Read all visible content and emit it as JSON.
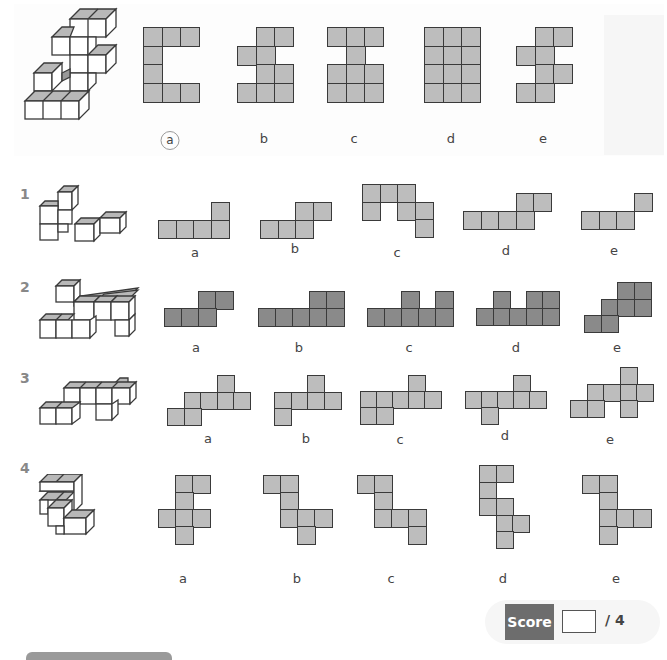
{
  "page": {
    "theme": {
      "cell_light": "#bdbdbd",
      "cell_dark": "#8a8a8a",
      "line": "#3a3a3a",
      "score_bg": "#6d6d6d"
    }
  },
  "example": {
    "answer_label": "a",
    "options": [
      {
        "label": "a",
        "circled": true,
        "x": 143,
        "y": 27,
        "size": 18.5,
        "label_x": 170,
        "label_y": 131,
        "cells": [
          [
            0,
            0
          ],
          [
            1,
            0
          ],
          [
            2,
            0
          ],
          [
            0,
            1
          ],
          [
            0,
            2
          ],
          [
            0,
            3
          ],
          [
            1,
            3
          ],
          [
            2,
            3
          ]
        ]
      },
      {
        "label": "b",
        "circled": false,
        "x": 237,
        "y": 27,
        "size": 18.5,
        "label_x": 264,
        "label_y": 131,
        "cells": [
          [
            1,
            0
          ],
          [
            2,
            0
          ],
          [
            0,
            1
          ],
          [
            1,
            1
          ],
          [
            1,
            2
          ],
          [
            2,
            2
          ],
          [
            0,
            3
          ],
          [
            1,
            3
          ],
          [
            2,
            3
          ]
        ]
      },
      {
        "label": "c",
        "circled": false,
        "x": 327,
        "y": 27,
        "size": 18.5,
        "label_x": 354,
        "label_y": 131,
        "cells": [
          [
            0,
            0
          ],
          [
            1,
            0
          ],
          [
            2,
            0
          ],
          [
            1,
            1
          ],
          [
            0,
            2
          ],
          [
            1,
            2
          ],
          [
            2,
            2
          ],
          [
            0,
            3
          ],
          [
            1,
            3
          ],
          [
            2,
            3
          ]
        ]
      },
      {
        "label": "d",
        "circled": false,
        "x": 424,
        "y": 27,
        "size": 18.5,
        "label_x": 451,
        "label_y": 131,
        "cells": [
          [
            0,
            0
          ],
          [
            1,
            0
          ],
          [
            2,
            0
          ],
          [
            0,
            1
          ],
          [
            1,
            1
          ],
          [
            2,
            1
          ],
          [
            0,
            2
          ],
          [
            1,
            2
          ],
          [
            2,
            2
          ],
          [
            0,
            3
          ],
          [
            1,
            3
          ],
          [
            2,
            3
          ]
        ]
      },
      {
        "label": "e",
        "circled": false,
        "x": 516,
        "y": 27,
        "size": 18.5,
        "label_x": 543,
        "label_y": 131,
        "cells": [
          [
            1,
            0
          ],
          [
            2,
            0
          ],
          [
            0,
            1
          ],
          [
            1,
            1
          ],
          [
            1,
            2
          ],
          [
            2,
            2
          ],
          [
            0,
            3
          ],
          [
            1,
            3
          ]
        ]
      }
    ]
  },
  "questions": [
    {
      "number": "1",
      "num_x": 20,
      "num_y": 186,
      "shade": "light",
      "options": [
        {
          "label": "a",
          "x": 158,
          "y": 202,
          "size": 17.5,
          "label_x": 195,
          "label_y": 245,
          "cells": [
            [
              3,
              0
            ],
            [
              0,
              1
            ],
            [
              1,
              1
            ],
            [
              2,
              1
            ],
            [
              3,
              1
            ]
          ]
        },
        {
          "label": "b",
          "x": 260,
          "y": 202,
          "size": 17.5,
          "label_x": 295,
          "label_y": 241,
          "cells": [
            [
              2,
              0
            ],
            [
              3,
              0
            ],
            [
              0,
              1
            ],
            [
              1,
              1
            ],
            [
              2,
              1
            ]
          ]
        },
        {
          "label": "c",
          "x": 362,
          "y": 184,
          "size": 17.5,
          "label_x": 397,
          "label_y": 245,
          "cells": [
            [
              0,
              0
            ],
            [
              1,
              0
            ],
            [
              2,
              0
            ],
            [
              0,
              1
            ],
            [
              2,
              1
            ],
            [
              3,
              1
            ],
            [
              3,
              2
            ]
          ]
        },
        {
          "label": "d",
          "x": 463,
          "y": 193,
          "size": 17.5,
          "label_x": 506,
          "label_y": 243,
          "cells": [
            [
              3,
              0
            ],
            [
              4,
              0
            ],
            [
              0,
              1
            ],
            [
              1,
              1
            ],
            [
              2,
              1
            ],
            [
              3,
              1
            ]
          ]
        },
        {
          "label": "e",
          "x": 581,
          "y": 193,
          "size": 17.5,
          "label_x": 614,
          "label_y": 243,
          "cells": [
            [
              3,
              0
            ],
            [
              0,
              1
            ],
            [
              1,
              1
            ],
            [
              2,
              1
            ]
          ]
        }
      ]
    },
    {
      "number": "2",
      "num_x": 20,
      "num_y": 279,
      "shade": "dark",
      "options": [
        {
          "label": "a",
          "x": 164,
          "y": 291,
          "size": 17,
          "label_x": 196,
          "label_y": 340,
          "cells": [
            [
              2,
              0
            ],
            [
              3,
              0
            ],
            [
              0,
              1
            ],
            [
              1,
              1
            ],
            [
              2,
              1
            ]
          ]
        },
        {
          "label": "b",
          "x": 258,
          "y": 291,
          "size": 17,
          "label_x": 299,
          "label_y": 340,
          "cells": [
            [
              3,
              0
            ],
            [
              4,
              0
            ],
            [
              0,
              1
            ],
            [
              1,
              1
            ],
            [
              2,
              1
            ],
            [
              3,
              1
            ],
            [
              4,
              1
            ]
          ]
        },
        {
          "label": "c",
          "x": 367,
          "y": 291,
          "size": 17,
          "label_x": 409,
          "label_y": 340,
          "cells": [
            [
              2,
              0
            ],
            [
              4,
              0
            ],
            [
              0,
              1
            ],
            [
              1,
              1
            ],
            [
              2,
              1
            ],
            [
              3,
              1
            ],
            [
              4,
              1
            ]
          ]
        },
        {
          "label": "d",
          "x": 476,
          "y": 291,
          "size": 16.5,
          "label_x": 516,
          "label_y": 340,
          "cells": [
            [
              1,
              0
            ],
            [
              3,
              0
            ],
            [
              4,
              0
            ],
            [
              0,
              1
            ],
            [
              1,
              1
            ],
            [
              2,
              1
            ],
            [
              3,
              1
            ],
            [
              4,
              1
            ]
          ]
        },
        {
          "label": "e",
          "x": 584,
          "y": 282,
          "size": 16.5,
          "label_x": 617,
          "label_y": 340,
          "cells": [
            [
              2,
              0
            ],
            [
              3,
              0
            ],
            [
              1,
              1
            ],
            [
              2,
              1
            ],
            [
              3,
              1
            ],
            [
              0,
              2
            ],
            [
              1,
              2
            ]
          ]
        }
      ]
    },
    {
      "number": "3",
      "num_x": 20,
      "num_y": 370,
      "shade": "light",
      "options": [
        {
          "label": "a",
          "x": 167,
          "y": 375,
          "size": 16.5,
          "label_x": 208,
          "label_y": 431,
          "cells": [
            [
              3,
              0
            ],
            [
              1,
              1
            ],
            [
              2,
              1
            ],
            [
              3,
              1
            ],
            [
              4,
              1
            ],
            [
              0,
              2
            ],
            [
              1,
              2
            ]
          ]
        },
        {
          "label": "b",
          "x": 274,
          "y": 375,
          "size": 16.5,
          "label_x": 306,
          "label_y": 431,
          "cells": [
            [
              2,
              0
            ],
            [
              0,
              1
            ],
            [
              1,
              1
            ],
            [
              2,
              1
            ],
            [
              3,
              1
            ],
            [
              0,
              2
            ]
          ]
        },
        {
          "label": "c",
          "x": 360,
          "y": 375,
          "size": 16,
          "label_x": 400,
          "label_y": 432,
          "cells": [
            [
              3,
              0
            ],
            [
              0,
              1
            ],
            [
              1,
              1
            ],
            [
              2,
              1
            ],
            [
              3,
              1
            ],
            [
              4,
              1
            ],
            [
              0,
              2
            ],
            [
              1,
              2
            ]
          ]
        },
        {
          "label": "d",
          "x": 465,
          "y": 375,
          "size": 16,
          "label_x": 505,
          "label_y": 428,
          "cells": [
            [
              3,
              0
            ],
            [
              0,
              1
            ],
            [
              1,
              1
            ],
            [
              2,
              1
            ],
            [
              3,
              1
            ],
            [
              4,
              1
            ],
            [
              1,
              2
            ]
          ]
        },
        {
          "label": "e",
          "x": 570,
          "y": 367,
          "size": 16.5,
          "label_x": 610,
          "label_y": 432,
          "cells": [
            [
              3,
              0
            ],
            [
              1,
              1
            ],
            [
              2,
              1
            ],
            [
              3,
              1
            ],
            [
              4,
              1
            ],
            [
              0,
              2
            ],
            [
              1,
              2
            ],
            [
              3,
              2
            ]
          ]
        }
      ]
    },
    {
      "number": "4",
      "num_x": 20,
      "num_y": 460,
      "shade": "light",
      "options": [
        {
          "label": "a",
          "x": 158,
          "y": 475,
          "size": 17,
          "label_x": 183,
          "label_y": 571,
          "cells": [
            [
              1,
              0
            ],
            [
              2,
              0
            ],
            [
              1,
              1
            ],
            [
              0,
              2
            ],
            [
              1,
              2
            ],
            [
              2,
              2
            ],
            [
              1,
              3
            ]
          ]
        },
        {
          "label": "b",
          "x": 263,
          "y": 475,
          "size": 17,
          "label_x": 297,
          "label_y": 571,
          "cells": [
            [
              0,
              0
            ],
            [
              1,
              0
            ],
            [
              1,
              1
            ],
            [
              1,
              2
            ],
            [
              2,
              2
            ],
            [
              3,
              2
            ],
            [
              2,
              3
            ]
          ]
        },
        {
          "label": "c",
          "x": 357,
          "y": 475,
          "size": 17,
          "label_x": 391,
          "label_y": 571,
          "cells": [
            [
              0,
              0
            ],
            [
              1,
              0
            ],
            [
              1,
              1
            ],
            [
              1,
              2
            ],
            [
              2,
              2
            ],
            [
              3,
              2
            ],
            [
              3,
              3
            ]
          ]
        },
        {
          "label": "d",
          "x": 479,
          "y": 465,
          "size": 16.5,
          "label_x": 503,
          "label_y": 571,
          "cells": [
            [
              0,
              0
            ],
            [
              1,
              0
            ],
            [
              0,
              1
            ],
            [
              0,
              2
            ],
            [
              1,
              2
            ],
            [
              1,
              3
            ],
            [
              2,
              3
            ],
            [
              1,
              4
            ]
          ]
        },
        {
          "label": "e",
          "x": 582,
          "y": 475,
          "size": 17,
          "label_x": 616,
          "label_y": 571,
          "cells": [
            [
              0,
              0
            ],
            [
              1,
              0
            ],
            [
              1,
              1
            ],
            [
              1,
              2
            ],
            [
              2,
              2
            ],
            [
              3,
              2
            ],
            [
              1,
              3
            ]
          ]
        }
      ]
    }
  ],
  "score": {
    "label": "Score",
    "value": "",
    "total": "/ 4"
  }
}
